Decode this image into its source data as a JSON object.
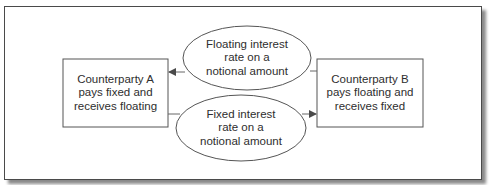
{
  "diagram": {
    "type": "interest-rate-swap-flow",
    "colors": {
      "stroke": "#555555",
      "text": "#2e2e2e",
      "background": "#ffffff",
      "frame_border": "#4a4a4a",
      "shadow": "#8a8a8a"
    },
    "nodes": {
      "counterparty_a": {
        "shape": "rectangle",
        "lines": [
          "Counterparty A",
          "pays fixed and",
          "receives floating"
        ]
      },
      "counterparty_b": {
        "shape": "rectangle",
        "lines": [
          "Counterparty B",
          "pays floating and",
          "receives fixed"
        ]
      },
      "floating_flow": {
        "shape": "ellipse",
        "lines": [
          "Floating interest",
          "rate on a",
          "notional amount"
        ]
      },
      "fixed_flow": {
        "shape": "ellipse",
        "lines": [
          "Fixed interest",
          "rate on a",
          "notional amount"
        ]
      }
    },
    "edges": [
      {
        "from": "counterparty_b",
        "via": "floating_flow",
        "to": "counterparty_a",
        "arrowhead": "at counterparty_a"
      },
      {
        "from": "counterparty_a",
        "via": "fixed_flow",
        "to": "counterparty_b",
        "arrowhead": "at counterparty_b"
      }
    ]
  }
}
